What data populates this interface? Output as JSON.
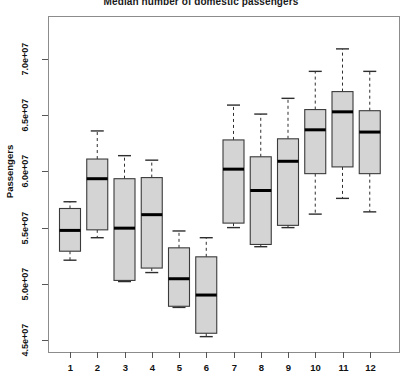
{
  "chart_data": {
    "type": "box",
    "title": "Median number of domestic passengers",
    "xlabel": "",
    "ylabel": "Passengers",
    "grid": false,
    "legend": "none",
    "xlim": [
      0.4,
      12.6
    ],
    "ylim": [
      43700000,
      73000000
    ],
    "yticks": [
      45000000,
      50000000,
      55000000,
      60000000,
      65000000,
      70000000
    ],
    "ytick_labels": [
      "4.5e+07",
      "5.0e+07",
      "5.5e+07",
      "6.0e+07",
      "6.5e+07",
      "7.0e+07"
    ],
    "xticks": [
      1,
      2,
      3,
      4,
      5,
      6,
      7,
      8,
      9,
      10,
      11,
      12
    ],
    "xtick_labels": [
      "1",
      "2",
      "3",
      "4",
      "5",
      "6",
      "7",
      "8",
      "9",
      "10",
      "11",
      "12"
    ],
    "box_fill": "#d4d4d4",
    "box_stroke": "#3a3a3a",
    "median_stroke": "#000000",
    "categories": [
      "1",
      "2",
      "3",
      "4",
      "5",
      "6",
      "7",
      "8",
      "9",
      "10",
      "11",
      "12"
    ],
    "boxes": [
      {
        "category": "1",
        "whisker_low": 52100000,
        "q1": 52900000,
        "median": 54750000,
        "q3": 56700000,
        "whisker_high": 57300000
      },
      {
        "category": "2",
        "whisker_low": 54100000,
        "q1": 54800000,
        "median": 59350000,
        "q3": 61100000,
        "whisker_high": 63600000
      },
      {
        "category": "3",
        "whisker_low": 50200000,
        "q1": 50300000,
        "median": 54950000,
        "q3": 59350000,
        "whisker_high": 61400000
      },
      {
        "category": "4",
        "whisker_low": 51000000,
        "q1": 51400000,
        "median": 56150000,
        "q3": 59450000,
        "whisker_high": 61000000
      },
      {
        "category": "5",
        "whisker_low": 47900000,
        "q1": 48000000,
        "median": 50450000,
        "q3": 53200000,
        "whisker_high": 54700000
      },
      {
        "category": "6",
        "whisker_low": 45300000,
        "q1": 45600000,
        "median": 49000000,
        "q3": 52400000,
        "whisker_high": 54100000
      },
      {
        "category": "7",
        "whisker_low": 55000000,
        "q1": 55400000,
        "median": 60200000,
        "q3": 62800000,
        "whisker_high": 65900000
      },
      {
        "category": "8",
        "whisker_low": 53300000,
        "q1": 53500000,
        "median": 58300000,
        "q3": 61300000,
        "whisker_high": 65100000
      },
      {
        "category": "9",
        "whisker_low": 55000000,
        "q1": 55200000,
        "median": 60900000,
        "q3": 62900000,
        "whisker_high": 66500000
      },
      {
        "category": "10",
        "whisker_low": 56200000,
        "q1": 59800000,
        "median": 63700000,
        "q3": 65500000,
        "whisker_high": 68900000
      },
      {
        "category": "11",
        "whisker_low": 57600000,
        "q1": 60400000,
        "median": 65300000,
        "q3": 67100000,
        "whisker_high": 70900000
      },
      {
        "category": "12",
        "whisker_low": 56400000,
        "q1": 59800000,
        "median": 63500000,
        "q3": 65400000,
        "whisker_high": 68900000
      }
    ]
  }
}
